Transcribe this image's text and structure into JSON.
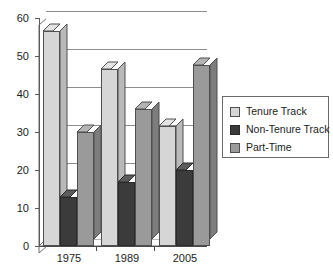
{
  "chart_data": {
    "type": "bar",
    "title": "",
    "subtitle": "",
    "xlabel": "",
    "ylabel": "",
    "categories": [
      "1975",
      "1989",
      "2005"
    ],
    "series": [
      {
        "name": "Tenure Track",
        "values": [
          56.5,
          46.5,
          31.5
        ],
        "color": "#d6d6d6"
      },
      {
        "name": "Non-Tenure Track",
        "values": [
          13.0,
          16.8,
          20.0
        ],
        "color": "#3b3b3b"
      },
      {
        "name": "Part-Time",
        "values": [
          30.0,
          36.0,
          47.5
        ],
        "color": "#9a9a9a"
      }
    ],
    "ylim": [
      0,
      60
    ],
    "yticks": [
      0,
      10,
      20,
      30,
      40,
      50,
      60
    ],
    "ytick_labels": [
      "0",
      "10",
      "20",
      "30",
      "40",
      "50",
      "60"
    ],
    "grid": true,
    "grid_axis": "y",
    "legend_position": "right",
    "style": "3d-bars",
    "background": "#ffffff",
    "frame_color": "#6e6e6e"
  },
  "legend": {
    "entries": [
      {
        "label": "Tenure Track"
      },
      {
        "label": "Non-Tenure Track"
      },
      {
        "label": "Part-Time"
      }
    ]
  },
  "axes": {
    "y_labels": [
      "60",
      "50",
      "40",
      "30",
      "20",
      "10",
      "0"
    ],
    "x_labels": [
      "1975",
      "1989",
      "2005"
    ]
  }
}
